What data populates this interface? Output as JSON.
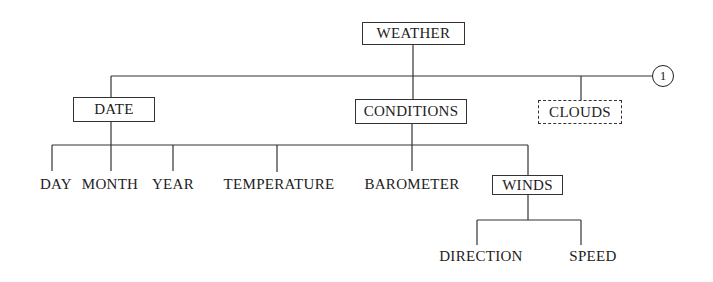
{
  "diagram": {
    "root": {
      "label": "WEATHER"
    },
    "level1": [
      {
        "label": "DATE",
        "style": "solid"
      },
      {
        "label": "CONDITIONS",
        "style": "solid"
      },
      {
        "label": "CLOUDS",
        "style": "dashed"
      }
    ],
    "connector": {
      "label": "1"
    },
    "leaves": [
      {
        "label": "DAY"
      },
      {
        "label": "MONTH"
      },
      {
        "label": "YEAR"
      },
      {
        "label": "TEMPERATURE"
      },
      {
        "label": "BAROMETER"
      },
      {
        "label": "WINDS",
        "boxed": true
      }
    ],
    "winds_children": [
      {
        "label": "DIRECTION"
      },
      {
        "label": "SPEED"
      }
    ]
  }
}
